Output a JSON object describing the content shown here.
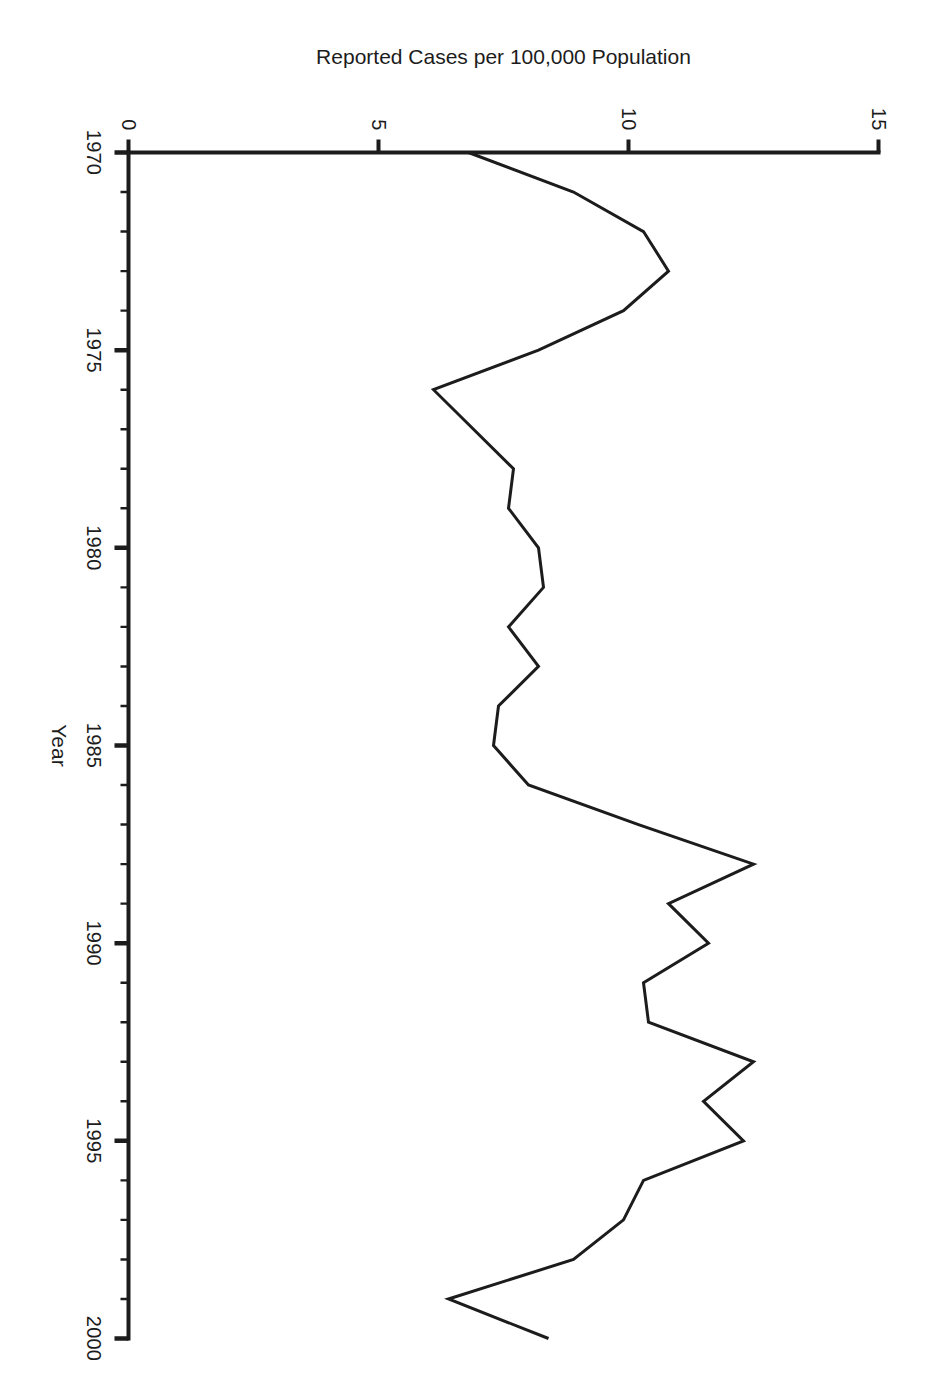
{
  "figure": {
    "background_color": "#ffffff",
    "ink_color": "#1c1c1c",
    "orientation_note": "rotated-90-clockwise"
  },
  "chart_data": {
    "type": "line",
    "title": "",
    "xlabel": "Year",
    "ylabel": "Reported Cases per 100,000 Population",
    "xlim": [
      1970,
      2000
    ],
    "ylim": [
      0,
      15
    ],
    "grid": false,
    "legend": null,
    "x_major_ticks": [
      1970,
      1975,
      1980,
      1985,
      1990,
      1995,
      2000
    ],
    "x_major_tick_labels": [
      "1970",
      "1975",
      "1980",
      "1985",
      "1990",
      "1995",
      "2000"
    ],
    "x_minor_tick_step": 1,
    "y_major_ticks": [
      0,
      5,
      10,
      15
    ],
    "y_major_tick_labels": [
      "0",
      "5",
      "10",
      "15"
    ],
    "series": [
      {
        "name": "Reported Cases per 100,000 Population",
        "color": "#1c1c1c",
        "line_width": 3,
        "x": [
          1970,
          1971,
          1972,
          1973,
          1974,
          1975,
          1976,
          1977,
          1978,
          1979,
          1980,
          1981,
          1982,
          1983,
          1984,
          1985,
          1986,
          1987,
          1988,
          1989,
          1990,
          1991,
          1992,
          1993,
          1994,
          1995,
          1996,
          1997,
          1998,
          1999,
          2000
        ],
        "values": [
          6.8,
          8.9,
          10.3,
          10.8,
          9.9,
          8.2,
          6.1,
          6.9,
          7.7,
          7.6,
          8.2,
          8.3,
          7.6,
          8.2,
          7.4,
          7.3,
          8.0,
          10.2,
          12.5,
          10.8,
          11.6,
          10.3,
          10.4,
          12.5,
          11.5,
          12.3,
          10.3,
          9.9,
          8.9,
          6.4,
          8.4
        ]
      }
    ]
  },
  "axes": {
    "x_title": "Year",
    "y_title": "Reported Cases per 100,000 Population"
  }
}
